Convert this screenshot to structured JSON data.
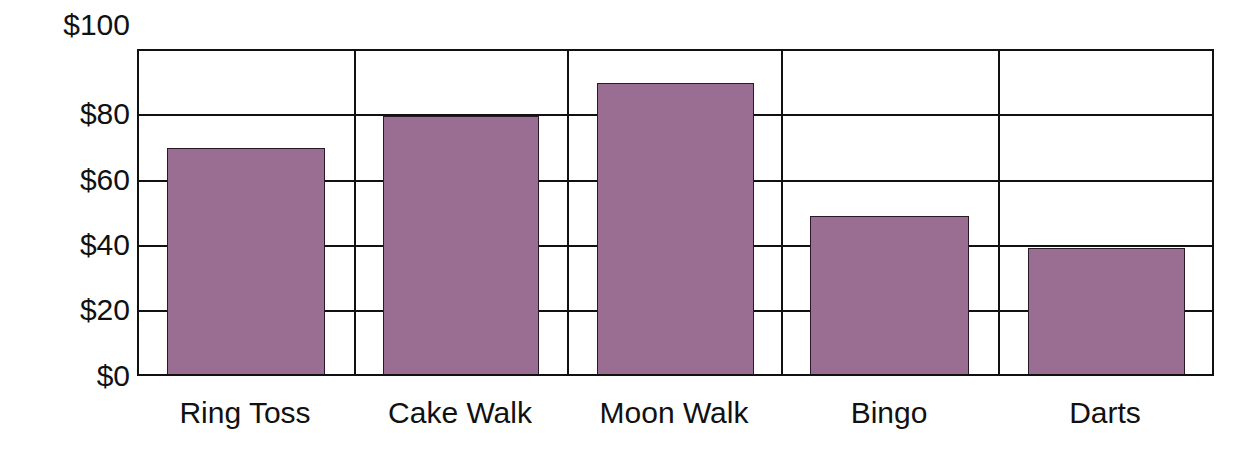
{
  "chart_data": {
    "type": "bar",
    "title": "",
    "xlabel": "",
    "ylabel": "",
    "categories": [
      "Ring Toss",
      "Cake Walk",
      "Moon Walk",
      "Bingo",
      "Darts"
    ],
    "values": [
      70,
      80,
      90,
      49,
      39
    ],
    "ylim": [
      0,
      100
    ],
    "yticks": [
      0,
      20,
      40,
      60,
      80,
      100
    ],
    "ytick_labels": [
      "$0",
      "$20",
      "$40",
      "$60",
      "$80",
      "$100"
    ],
    "grid": true,
    "legend": null,
    "bar_color": "#9a6d93"
  },
  "y_axis": {
    "labels": [
      "$0",
      "$20",
      "$40",
      "$60",
      "$80",
      "$100"
    ]
  },
  "x_axis": {
    "labels": [
      "Ring Toss",
      "Cake Walk",
      "Moon Walk",
      "Bingo",
      "Darts"
    ]
  }
}
